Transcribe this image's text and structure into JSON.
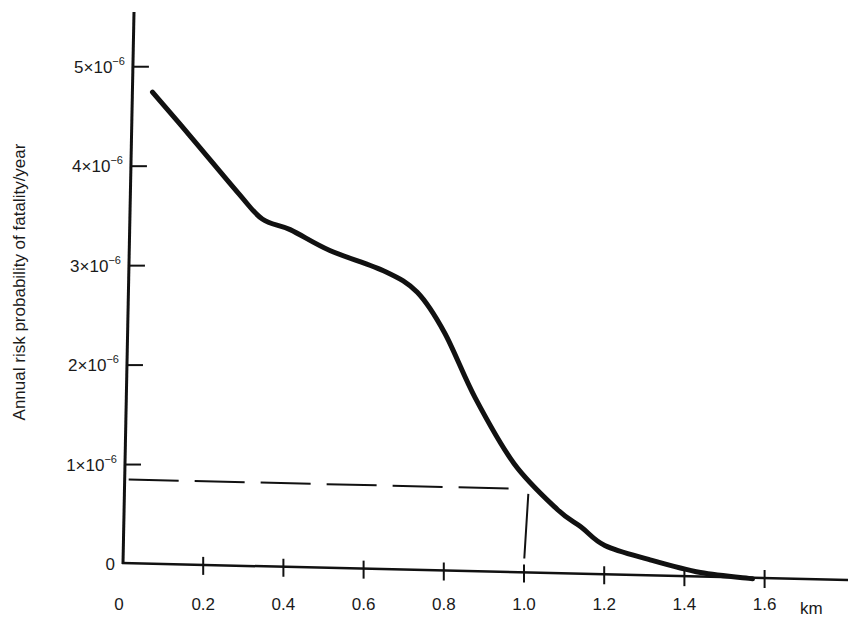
{
  "chart_data": {
    "type": "line",
    "title": "",
    "xlabel": "km",
    "ylabel": "Annual risk probability of fatality/year",
    "xlim": [
      0,
      1.8
    ],
    "ylim": [
      0,
      5.4e-06
    ],
    "grid": false,
    "legend": null,
    "x_ticks": [
      "0",
      "0.2",
      "0.4",
      "0.6",
      "0.8",
      "1.0",
      "1.2",
      "1.4",
      "1.6"
    ],
    "y_ticks": [
      {
        "mantissa": "0",
        "exp": "",
        "value": 0
      },
      {
        "mantissa": "1×10",
        "exp": "−6",
        "value": 1e-06
      },
      {
        "mantissa": "2×10",
        "exp": "−6",
        "value": 2e-06
      },
      {
        "mantissa": "3×10",
        "exp": "−6",
        "value": 3e-06
      },
      {
        "mantissa": "4×10",
        "exp": "−6",
        "value": 4e-06
      },
      {
        "mantissa": "5×10",
        "exp": "−6",
        "value": 5e-06
      }
    ],
    "series": [
      {
        "name": "Annual risk vs distance",
        "x": [
          0.05,
          0.15,
          0.27,
          0.33,
          0.4,
          0.5,
          0.64,
          0.72,
          0.79,
          0.87,
          0.97,
          1.08,
          1.14,
          1.2,
          1.31,
          1.44,
          1.57
        ],
        "y": [
          4.75e-06,
          4.3e-06,
          3.75e-06,
          3.5e-06,
          3.4e-06,
          3.2e-06,
          3e-06,
          2.8e-06,
          2.4e-06,
          1.75e-06,
          1.1e-06,
          6.5e-07,
          4.8e-07,
          3e-07,
          1.7e-07,
          5e-08,
          0.0
        ]
      }
    ],
    "annotations": [
      {
        "type": "dashed-horizontal",
        "y": 8.5e-07,
        "x_from": 0,
        "x_to": 1.0
      },
      {
        "type": "dashed-vertical",
        "x": 1.0,
        "y_from": 1.5e-07,
        "y_to": 8e-07
      }
    ]
  }
}
